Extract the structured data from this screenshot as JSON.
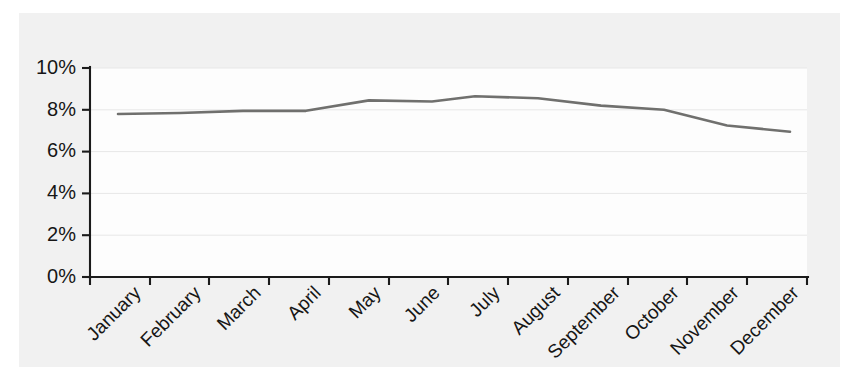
{
  "figure": {
    "background_color": "#ffffff",
    "panel_color": "#f1f1f1",
    "plot_background_color": "#fdfdfd"
  },
  "chart_data": {
    "type": "line",
    "title": "",
    "subtitle": "",
    "xlabel": "",
    "ylabel": "",
    "categories": [
      "January",
      "February",
      "March",
      "April",
      "May",
      "June",
      "July",
      "August",
      "September",
      "October",
      "November",
      "December"
    ],
    "values": [
      7.8,
      7.85,
      7.95,
      7.95,
      8.45,
      8.4,
      8.65,
      8.55,
      8.2,
      8.0,
      7.25,
      6.95
    ],
    "series": [
      {
        "name": "",
        "values": [
          7.8,
          7.85,
          7.95,
          7.95,
          8.45,
          8.4,
          8.65,
          8.55,
          8.2,
          8.0,
          7.25,
          6.95
        ],
        "color": "#70706e"
      }
    ],
    "ylim": [
      0,
      10
    ],
    "ytick_values": [
      0,
      2,
      4,
      6,
      8,
      10
    ],
    "ytick_labels": [
      "0%",
      "2%",
      "4%",
      "6%",
      "8%",
      "10%"
    ],
    "xtick_labels": [
      "January",
      "February",
      "March",
      "April",
      "May",
      "June",
      "July",
      "August",
      "September",
      "October",
      "November",
      "December"
    ],
    "xtick_rotation_degrees": -45,
    "grid": true,
    "grid_axis": "y",
    "legend": false,
    "legend_position": "none",
    "annotations": [],
    "line_color": "#70706e",
    "axis_color": "#1b1b1b",
    "grid_color": "#e7e7e7"
  },
  "geometry": {
    "plot_left": 90,
    "plot_right": 807,
    "plot_top": 68,
    "plot_bottom": 277,
    "x_positions": [
      118,
      180,
      243,
      306,
      369,
      432,
      475,
      538,
      601,
      664,
      727,
      790
    ]
  }
}
